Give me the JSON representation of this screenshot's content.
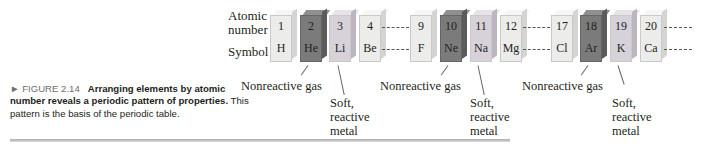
{
  "figure": {
    "number": "FIGURE 2.14",
    "bold_caption": "Arranging elements by atomic number reveals a periodic pattern of properties.",
    "caption_rest": "This pattern is the basis of the periodic table."
  },
  "row_labels": {
    "atomic_number": "Atomic number",
    "atomic_line1": "Atomic",
    "atomic_line2": "number",
    "symbol": "Symbol"
  },
  "elements": [
    {
      "number": "1",
      "symbol": "H",
      "style": "light"
    },
    {
      "number": "2",
      "symbol": "He",
      "style": "dark"
    },
    {
      "number": "3",
      "symbol": "Li",
      "style": "lilac"
    },
    {
      "number": "4",
      "symbol": "Be",
      "style": "light"
    },
    {
      "number": "9",
      "symbol": "F",
      "style": "light"
    },
    {
      "number": "10",
      "symbol": "Ne",
      "style": "dark"
    },
    {
      "number": "11",
      "symbol": "Na",
      "style": "lilac"
    },
    {
      "number": "12",
      "symbol": "Mg",
      "style": "light"
    },
    {
      "number": "17",
      "symbol": "Cl",
      "style": "light"
    },
    {
      "number": "18",
      "symbol": "Ar",
      "style": "dark"
    },
    {
      "number": "19",
      "symbol": "K",
      "style": "lilac"
    },
    {
      "number": "20",
      "symbol": "Ca",
      "style": "light"
    }
  ],
  "annotations": {
    "nonreactive_gas": "Nonreactive gas",
    "soft": "Soft,",
    "reactive": "reactive",
    "metal": "metal"
  }
}
